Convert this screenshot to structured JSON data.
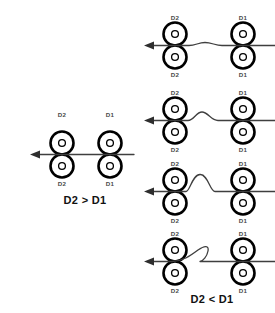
{
  "diagram": {
    "labels": {
      "left_roller": "D2",
      "right_roller": "D1"
    },
    "captions": {
      "left": "D2 > D1",
      "right": "D2 < D1"
    },
    "colors": {
      "roller_stroke": "#000000",
      "web_line": "#3f3f3f",
      "label_text": "#4a4a4a",
      "caption_text": "#111111",
      "background": "#ffffff"
    },
    "panels": [
      {
        "id": "panel-left",
        "name": "overdriven-web-taut",
        "caption": "D2 > D1",
        "web_state": "straight",
        "feed_direction": "left",
        "roller_pairs": [
          {
            "position": "left",
            "top_label": "D2",
            "bottom_label": "D2"
          },
          {
            "position": "right",
            "top_label": "D1",
            "bottom_label": "D1"
          }
        ]
      },
      {
        "id": "panel-stage-1",
        "name": "slight-slack",
        "web_state": "slight-wave",
        "buckle_amplitude": 1,
        "feed_direction": "left",
        "roller_pairs": [
          {
            "position": "left",
            "top_label": "D2",
            "bottom_label": "D2"
          },
          {
            "position": "right",
            "top_label": "D1",
            "bottom_label": "D1"
          }
        ]
      },
      {
        "id": "panel-stage-2",
        "name": "small-buckle",
        "web_state": "small-bump",
        "buckle_amplitude": 2,
        "feed_direction": "left",
        "roller_pairs": [
          {
            "position": "left",
            "top_label": "D2",
            "bottom_label": "D2"
          },
          {
            "position": "right",
            "top_label": "D1",
            "bottom_label": "D1"
          }
        ]
      },
      {
        "id": "panel-stage-3",
        "name": "large-buckle",
        "web_state": "tall-bump",
        "buckle_amplitude": 3,
        "feed_direction": "left",
        "roller_pairs": [
          {
            "position": "left",
            "top_label": "D2",
            "bottom_label": "D2"
          },
          {
            "position": "right",
            "top_label": "D1",
            "bottom_label": "D1"
          }
        ]
      },
      {
        "id": "panel-stage-4",
        "name": "folded-loop",
        "caption": "D2 < D1",
        "web_state": "folded-loop",
        "buckle_amplitude": 4,
        "feed_direction": "left",
        "roller_pairs": [
          {
            "position": "left",
            "top_label": "D2",
            "bottom_label": "D2"
          },
          {
            "position": "right",
            "top_label": "D1",
            "bottom_label": "D1"
          }
        ]
      }
    ]
  }
}
